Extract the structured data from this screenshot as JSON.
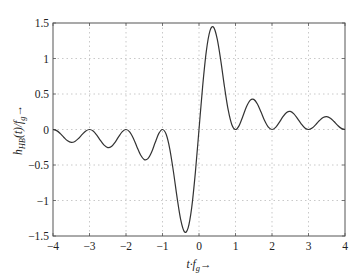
{
  "chart_data": {
    "type": "line",
    "title": "",
    "xlabel": "t·f_g →",
    "ylabel": "h_HB(t)/f_g →",
    "xlim": [
      -4,
      4
    ],
    "ylim": [
      -1.5,
      1.5
    ],
    "grid": true,
    "legend": null,
    "xticks": [
      -4,
      -3,
      -2,
      -1,
      0,
      1,
      2,
      3,
      4
    ],
    "yticks": [
      -1.5,
      -1,
      -0.5,
      0,
      0.5,
      1,
      1.5
    ],
    "xtick_labels": [
      "−4",
      "−3",
      "−2",
      "−1",
      "0",
      "1",
      "2",
      "3",
      "4"
    ],
    "ytick_labels": [
      "−1.5",
      "−1",
      "−0.5",
      "0",
      "0.5",
      "1",
      "1.5"
    ],
    "series": [
      {
        "name": "h_HB(t)/f_g",
        "color": "#333333",
        "x_start": 0.0,
        "x_step": 0.1,
        "odd_symmetric": true,
        "y_positive_half": [
          0,
          0.608,
          1.1,
          1.389,
          1.44,
          1.273,
          0.96,
          0.595,
          0.275,
          0.068,
          0,
          0.055,
          0.183,
          0.321,
          0.411,
          0.424,
          0.36,
          0.245,
          0.122,
          0.032,
          0,
          0.029,
          0.1,
          0.181,
          0.24,
          0.255,
          0.221,
          0.154,
          0.079,
          0.021,
          0,
          0.02,
          0.069,
          0.126,
          0.169,
          0.182,
          0.16,
          0.113,
          0.058,
          0.016,
          0
        ]
      }
    ]
  },
  "labels": {
    "xlabel_main": "t·f",
    "xlabel_sub": "g",
    "xlabel_arrow": "→",
    "ylabel_main": "h",
    "ylabel_sub": "HB",
    "ylabel_mid": "(t)/f",
    "ylabel_sub2": "g",
    "ylabel_arrow": "→"
  }
}
